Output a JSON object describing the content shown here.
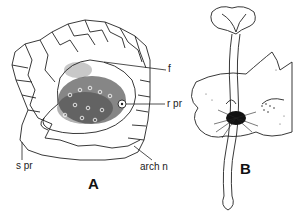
{
  "figure": {
    "panels": [
      {
        "id": "A",
        "letter": "A",
        "description": "Transverse section showing cellular tissue with a dense gametophore/protocorm region",
        "labels": [
          {
            "key": "f",
            "text": "f"
          },
          {
            "key": "r_pr",
            "text": "r pr"
          },
          {
            "key": "s_pr",
            "text": "s pr"
          },
          {
            "key": "arch_n",
            "text": "arch n"
          }
        ]
      },
      {
        "id": "B",
        "letter": "B",
        "description": "Seedling/sporophyte emerging from thallus with rhizoid cluster",
        "labels": []
      }
    ],
    "colors": {
      "ink": "#111111",
      "background": "#ffffff"
    }
  }
}
